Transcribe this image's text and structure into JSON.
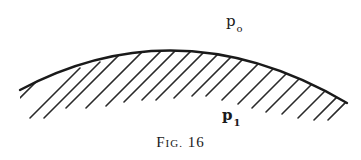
{
  "figure": {
    "caption_prefix": "F",
    "caption_smallcaps": "IG.",
    "caption_number": "16",
    "labels": {
      "top_symbol": "p",
      "top_subscript": "o",
      "bottom_symbol": "p",
      "bottom_subscript": "1"
    },
    "curve": {
      "description": "convex curved boundary with hatched region beneath",
      "stroke_color": "#1a1a1a",
      "hatch_color": "#2a2a2a",
      "left_end": [
        20,
        90
      ],
      "peak": [
        180,
        45
      ],
      "right_end": [
        347,
        103
      ]
    }
  }
}
